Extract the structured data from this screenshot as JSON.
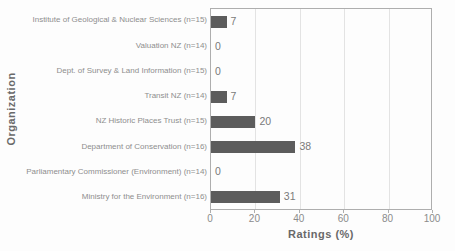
{
  "chart_data": {
    "type": "bar",
    "orientation": "horizontal",
    "title": "",
    "xlabel": "Ratings (%)",
    "ylabel": "Organization",
    "categories": [
      "Institute of Geological & Nuclear Sciences (n=15)",
      "Valuation NZ (n=14)",
      "Dept. of Survey & Land Information (n=15)",
      "Transit NZ (n=14)",
      "NZ Historic Places Trust (n=15)",
      "Department of Conservation (n=16)",
      "Parliamentary Commissioner (Environment) (n=14)",
      "Ministry for the Environment (n=16)"
    ],
    "values": [
      7,
      0,
      0,
      7,
      20,
      38,
      0,
      31
    ],
    "value_labels": [
      "7",
      "0",
      "0",
      "7",
      "20",
      "38",
      "0",
      "31"
    ],
    "xlim": [
      0,
      100
    ],
    "x_ticks": [
      0,
      20,
      40,
      60,
      80,
      100
    ],
    "x_tick_labels": [
      "0",
      "20",
      "40",
      "60",
      "80",
      "100"
    ],
    "gridlines_at": [
      20,
      40,
      60,
      80
    ],
    "legend": "none",
    "bar_color": "#5c5c5c"
  }
}
